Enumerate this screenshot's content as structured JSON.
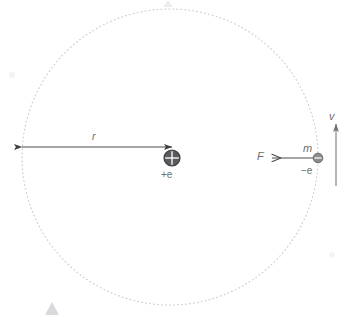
{
  "diagram": {
    "background_color": "#ffffff",
    "orbit": {
      "name": "electron-orbit",
      "style": "dotted",
      "center_x": 170,
      "center_y": 157,
      "radius": 148,
      "color": "#cfcfd4"
    },
    "nucleus": {
      "label": "+e",
      "symbol": "plus-in-circle",
      "center_x": 172,
      "center_y": 158,
      "radius": 8,
      "fill_color": "#555558",
      "mark_color": "#ffffff"
    },
    "electron": {
      "label": "−e",
      "mass_label": "m",
      "symbol": "minus-in-circle",
      "center_x": 318,
      "center_y": 158,
      "radius": 4.5,
      "fill_color": "#8d8d92",
      "mark_color": "#ffffff"
    },
    "radius_arrow": {
      "label": "r",
      "from_x": 22,
      "from_y": 147,
      "to_x": 172,
      "to_y": 147,
      "double_headed": true,
      "color": "#4a4a4d"
    },
    "force_arrow": {
      "label": "F",
      "from_x": 315,
      "from_y": 158,
      "to_x": 270,
      "to_y": 158,
      "direction": "left",
      "color": "#4a4a4d"
    },
    "velocity_arrow": {
      "label": "v",
      "from_x": 336,
      "from_y": 186,
      "to_x": 336,
      "to_y": 122,
      "direction": "up",
      "color": "#9a9a9f"
    },
    "label_color": "#6e6e6e"
  }
}
